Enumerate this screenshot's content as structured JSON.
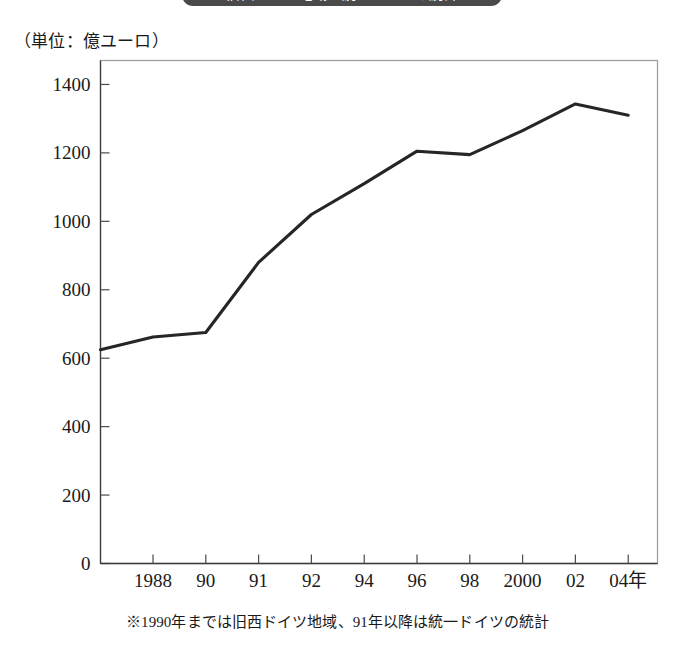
{
  "banner": {
    "text": "旧西ドイツ地域・統一ドイツの統計"
  },
  "unit_caption": "（単位：億ユーロ）",
  "footnote": "※1990年までは旧西ドイツ地域、91年以降は統一ドイツの統計",
  "colors": {
    "line": "#262626",
    "frame": "#9a9a9a",
    "axis": "#3a3a3a",
    "banner_bg": "#4a4a4a",
    "text": "#1a1a1a"
  },
  "chart_data": {
    "type": "line",
    "title": "旧西ドイツ地域・統一ドイツの統計",
    "xlabel": "年",
    "ylabel": "億ユーロ",
    "unit": "億ユーロ",
    "grid": false,
    "legend": "none",
    "ylim": [
      0,
      1470
    ],
    "yticks": [
      0,
      200,
      400,
      600,
      800,
      1000,
      1200,
      1400
    ],
    "ytick_labels": [
      "0",
      "200",
      "400",
      "600",
      "800",
      "1000",
      "1200",
      "1400"
    ],
    "xtick_labels": [
      "1988",
      "90",
      "91",
      "92",
      "94",
      "96",
      "98",
      "2000",
      "02",
      "04年"
    ],
    "x": [
      1987,
      1988,
      1990,
      1991,
      1992,
      1994,
      1996,
      1998,
      2000,
      2002,
      2004
    ],
    "values": [
      625,
      662,
      675,
      880,
      1020,
      1110,
      1205,
      1195,
      1265,
      1343,
      1310
    ],
    "series": [
      {
        "name": "ドイツ（億ユーロ）",
        "values": [
          625,
          662,
          675,
          880,
          1020,
          1110,
          1205,
          1195,
          1265,
          1343,
          1310
        ]
      }
    ],
    "notes": [
      "※1990年までは旧西ドイツ地域、91年以降は統一ドイツの統計"
    ]
  }
}
